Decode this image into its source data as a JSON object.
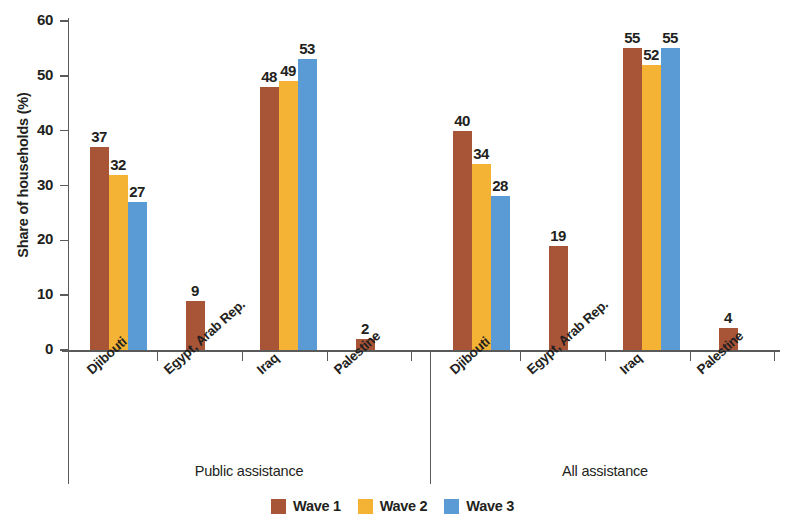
{
  "chart_data": {
    "type": "bar",
    "title": "",
    "xlabel": "",
    "ylabel": "Share of households (%)",
    "ylim": [
      0,
      60
    ],
    "yticks": [
      0,
      10,
      20,
      30,
      40,
      50,
      60
    ],
    "grid": false,
    "legend_position": "bottom",
    "categories": [
      "Djibouti",
      "Egypt, Arab Rep.",
      "Iraq",
      "Palestine"
    ],
    "panels": [
      {
        "name": "Public assistance",
        "series": [
          {
            "name": "Wave 1",
            "values": [
              37,
              9,
              48,
              2
            ]
          },
          {
            "name": "Wave 2",
            "values": [
              32,
              null,
              49,
              null
            ]
          },
          {
            "name": "Wave 3",
            "values": [
              27,
              null,
              53,
              null
            ]
          }
        ]
      },
      {
        "name": "All assistance",
        "series": [
          {
            "name": "Wave 1",
            "values": [
              40,
              19,
              55,
              4
            ]
          },
          {
            "name": "Wave 2",
            "values": [
              34,
              null,
              52,
              null
            ]
          },
          {
            "name": "Wave 3",
            "values": [
              28,
              null,
              55,
              null
            ]
          }
        ]
      }
    ],
    "series_colors": [
      "#a85437",
      "#f5b335",
      "#5b9bd5"
    ]
  },
  "axis": {
    "y_title": "Share of households (%)",
    "y_ticks": [
      "0",
      "10",
      "20",
      "30",
      "40",
      "50",
      "60"
    ]
  },
  "panel_titles": [
    "Public assistance",
    "All assistance"
  ],
  "category_labels": [
    "Djibouti",
    "Egypt, Arab Rep.",
    "Iraq",
    "Palestine"
  ],
  "legend": {
    "items": [
      {
        "label": "Wave 1",
        "color": "#a85437"
      },
      {
        "label": "Wave 2",
        "color": "#f5b335"
      },
      {
        "label": "Wave 3",
        "color": "#5b9bd5"
      }
    ]
  }
}
